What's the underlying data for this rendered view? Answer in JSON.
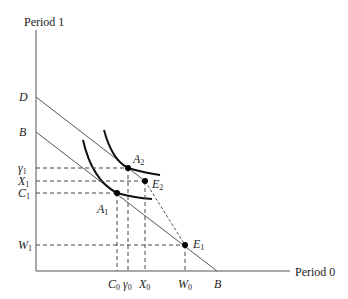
{
  "axes": {
    "y_label": "Period 1",
    "x_label": "Period 0"
  },
  "y_ticks": [
    {
      "name": "D",
      "sub": ""
    },
    {
      "name": "B",
      "sub": ""
    },
    {
      "name": "γ",
      "sub": "1"
    },
    {
      "name": "X",
      "sub": "1"
    },
    {
      "name": "C",
      "sub": "1"
    },
    {
      "name": "W",
      "sub": "1"
    }
  ],
  "x_ticks": [
    {
      "name": "C",
      "sub": "0"
    },
    {
      "name": "γ",
      "sub": "0"
    },
    {
      "name": "X",
      "sub": "0"
    },
    {
      "name": "W",
      "sub": "0"
    },
    {
      "name": "B",
      "sub": ""
    }
  ],
  "points": [
    {
      "name": "A",
      "sub": "2"
    },
    {
      "name": "E",
      "sub": "2"
    },
    {
      "name": "A",
      "sub": "1"
    },
    {
      "name": "E",
      "sub": "1"
    }
  ],
  "colors": {
    "line": "#555555",
    "curve": "#111111",
    "dash": "#444444"
  }
}
